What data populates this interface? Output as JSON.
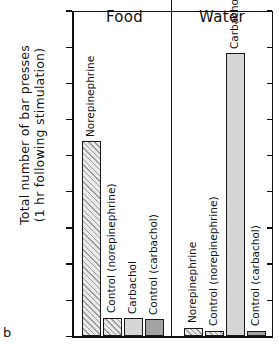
{
  "panel_label": "b",
  "axis": {
    "ylabel_line1": "Total number of bar presses",
    "ylabel_line2": "(1 hr following stimulation)",
    "ticks": [
      "225",
      "200",
      "175",
      "150",
      "125",
      "100",
      "75",
      "50",
      "25",
      "0"
    ]
  },
  "groups": [
    {
      "title": "Food"
    },
    {
      "title": "Water"
    }
  ],
  "bars": [
    {
      "label": "Norepinephrine",
      "value": 135
    },
    {
      "label": "Control (norepinephrine)",
      "value": 13
    },
    {
      "label": "Carbachol",
      "value": 12.5
    },
    {
      "label": "Control (carbachol)",
      "value": 12
    },
    {
      "label": "Norepinephrine",
      "value": 6
    },
    {
      "label": "Control (norepinephrine)",
      "value": 4
    },
    {
      "label": "Carbachol",
      "value": 196
    },
    {
      "label": "Control (carbachol)",
      "value": 4
    }
  ],
  "chart_data": {
    "type": "bar",
    "title": "",
    "panel": "b",
    "xlabel": "",
    "ylabel": "Total number of bar presses (1 hr following stimulation)",
    "ylim": [
      0,
      225
    ],
    "ytick_step": 25,
    "yticks": [
      0,
      25,
      50,
      75,
      100,
      125,
      150,
      175,
      200,
      225
    ],
    "grid": false,
    "legend": "none",
    "groups": [
      "Food",
      "Water"
    ],
    "categories": [
      "Norepinephrine",
      "Control (norepinephrine)",
      "Carbachol",
      "Control (carbachol)"
    ],
    "series": [
      {
        "name": "Food",
        "values": [
          135,
          13,
          12.5,
          12
        ]
      },
      {
        "name": "Water",
        "values": [
          6,
          4,
          196,
          4
        ]
      }
    ],
    "fills": [
      "hatch",
      "hatch",
      "light-gray",
      "dark-gray"
    ]
  }
}
